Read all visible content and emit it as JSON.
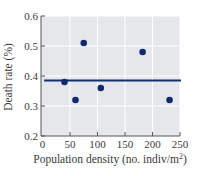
{
  "chart_data": {
    "type": "scatter",
    "title": "",
    "xlabel": "Population density (no. indiv/m²)",
    "xlabel_parts": {
      "main": "Population density (no. indiv/m",
      "sup": "2",
      "tail": ")"
    },
    "ylabel": "Death rate (%)",
    "xlim": [
      0,
      250
    ],
    "ylim": [
      0.2,
      0.6
    ],
    "x_ticks": [
      0,
      50,
      100,
      150,
      200,
      250
    ],
    "y_ticks": [
      0.2,
      0.3,
      0.4,
      0.5,
      0.6
    ],
    "x_tick_labels": [
      "0",
      "50",
      "100",
      "150",
      "200",
      "250"
    ],
    "y_tick_labels": [
      "0.2",
      "0.3",
      "0.4",
      "0.5",
      "0.6"
    ],
    "grid": true,
    "legend": null,
    "series": [
      {
        "name": "observations",
        "x": [
          40,
          60,
          75,
          106,
          182,
          231
        ],
        "y": [
          0.38,
          0.32,
          0.51,
          0.36,
          0.48,
          0.32
        ]
      }
    ],
    "reference_line": {
      "type": "horizontal",
      "y": 0.385,
      "x_start": 3,
      "x_end": 250
    }
  },
  "colors": {
    "plot_background": "#e6e7eb",
    "grid": "#ffffff",
    "points": "#112a6a",
    "line": "#12306f",
    "axis": "#555555"
  }
}
